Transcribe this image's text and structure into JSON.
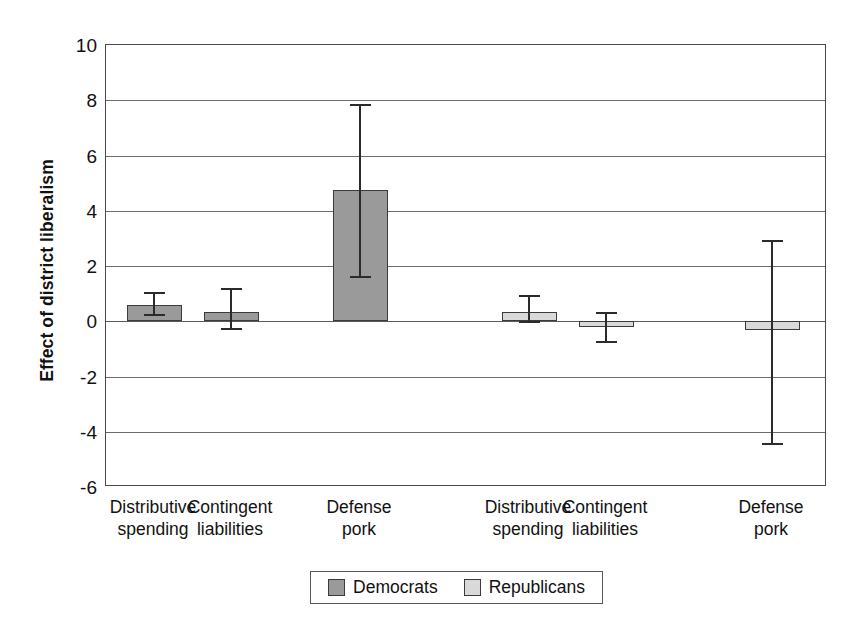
{
  "chart_data": {
    "type": "bar",
    "title": "",
    "subtitle": "",
    "xlabel": "",
    "ylabel": "Effect of district liberalism",
    "ylim": [
      -6,
      10
    ],
    "ytick_labels": [
      "10",
      "8",
      "6",
      "4",
      "2",
      "0",
      "-2",
      "-4",
      "-6"
    ],
    "yticks": [
      10,
      8,
      6,
      4,
      2,
      0,
      -2,
      -4,
      -6
    ],
    "grid": true,
    "legend_position": "bottom",
    "groups": [
      "Democrats",
      "Republicans"
    ],
    "categories": [
      "Distributive spending",
      "Contingent liabilities",
      "Defense pork"
    ],
    "category_lines": [
      [
        "Distributive",
        "spending"
      ],
      [
        "Contingent",
        "liabilities"
      ],
      [
        "Defense",
        "pork"
      ]
    ],
    "series": [
      {
        "name": "Democrats",
        "color": "#9a9a9a",
        "values": [
          0.58,
          0.33,
          4.75
        ],
        "err_low": [
          0.25,
          -0.25,
          1.65
        ],
        "err_high": [
          1.05,
          1.2,
          7.85
        ]
      },
      {
        "name": "Republicans",
        "color": "#d9d9d9",
        "values": [
          0.35,
          -0.2,
          -0.3
        ],
        "err_low": [
          0.0,
          -0.7,
          -4.4
        ],
        "err_high": [
          0.95,
          0.35,
          2.95
        ]
      }
    ],
    "legend": [
      {
        "label": "Democrats",
        "color": "#9a9a9a"
      },
      {
        "label": "Republicans",
        "color": "#d9d9d9"
      }
    ]
  },
  "colors": {
    "democrats": "#9a9a9a",
    "republicans": "#d9d9d9",
    "axis": "#4a4a4a",
    "grid": "#6b6b6b",
    "text": "#111111"
  }
}
